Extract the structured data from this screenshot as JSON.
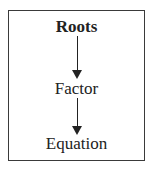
{
  "diagram": {
    "nodes": [
      {
        "label": "Roots",
        "bold": true
      },
      {
        "label": "Factor",
        "bold": false
      },
      {
        "label": "Equation",
        "bold": false
      }
    ],
    "edges": [
      {
        "from": "Roots",
        "to": "Factor"
      },
      {
        "from": "Factor",
        "to": "Equation"
      }
    ]
  }
}
